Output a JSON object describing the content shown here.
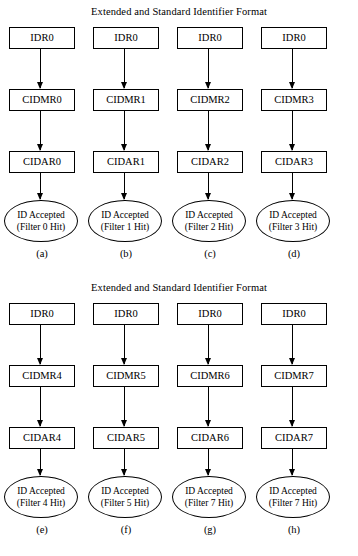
{
  "panels": [
    {
      "title": "Extended and Standard Identifier Format",
      "columns": [
        {
          "caption": "(a)",
          "idr": "IDR0",
          "cidmr": "CIDMR0",
          "cidar": "CIDAR0",
          "accepted_line1": "ID Accepted",
          "accepted_line2": "(Filter 0 Hit)"
        },
        {
          "caption": "(b)",
          "idr": "IDR0",
          "cidmr": "CIDMR1",
          "cidar": "CIDAR1",
          "accepted_line1": "ID Accepted",
          "accepted_line2": "(Filter 1 Hit)"
        },
        {
          "caption": "(c)",
          "idr": "IDR0",
          "cidmr": "CIDMR2",
          "cidar": "CIDAR2",
          "accepted_line1": "ID Accepted",
          "accepted_line2": "(Filter 2 Hit)"
        },
        {
          "caption": "(d)",
          "idr": "IDR0",
          "cidmr": "CIDMR3",
          "cidar": "CIDAR3",
          "accepted_line1": "ID Accepted",
          "accepted_line2": "(Filter 3 Hit)"
        }
      ]
    },
    {
      "title": "Extended and Standard Identifier Format",
      "columns": [
        {
          "caption": "(e)",
          "idr": "IDR0",
          "cidmr": "CIDMR4",
          "cidar": "CIDAR4",
          "accepted_line1": "ID Accepted",
          "accepted_line2": "(Filter 4 Hit)"
        },
        {
          "caption": "(f)",
          "idr": "IDR0",
          "cidmr": "CIDMR5",
          "cidar": "CIDAR5",
          "accepted_line1": "ID Accepted",
          "accepted_line2": "(Filter 5 Hit)"
        },
        {
          "caption": "(g)",
          "idr": "IDR0",
          "cidmr": "CIDMR6",
          "cidar": "CIDAR6",
          "accepted_line1": "ID Accepted",
          "accepted_line2": "(Filter 7 Hit)"
        },
        {
          "caption": "(h)",
          "idr": "IDR0",
          "cidmr": "CIDMR7",
          "cidar": "CIDAR7",
          "accepted_line1": "ID Accepted",
          "accepted_line2": "(Filter 7 Hit)"
        }
      ]
    }
  ],
  "colors": {
    "stroke": "#000000",
    "background": "#ffffff",
    "text": "#000000"
  }
}
